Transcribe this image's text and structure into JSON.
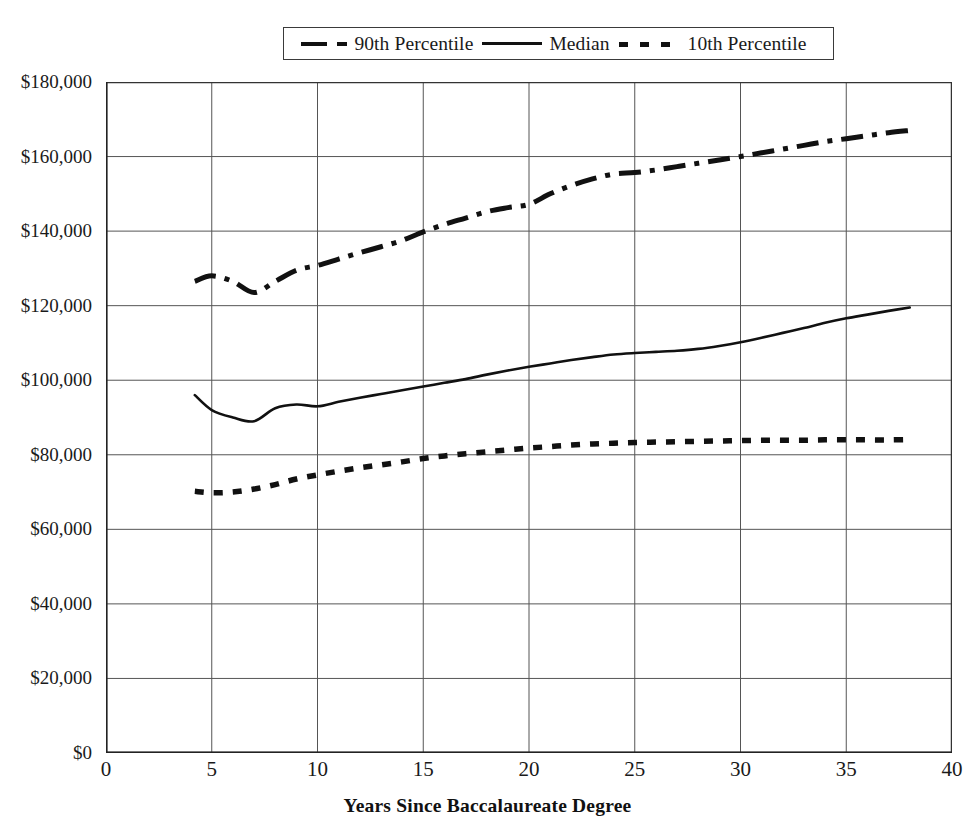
{
  "chart_data": {
    "type": "line",
    "title": "",
    "xlabel": "Years Since Baccalaureate Degree",
    "ylabel": "",
    "xlim": [
      0,
      40
    ],
    "ylim": [
      0,
      180000
    ],
    "grid": true,
    "legend_position": "top-center",
    "x_ticks": [
      0,
      5,
      10,
      15,
      20,
      25,
      30,
      35,
      40
    ],
    "x_tick_labels": [
      "0",
      "5",
      "10",
      "15",
      "20",
      "25",
      "30",
      "35",
      "40"
    ],
    "y_ticks": [
      0,
      20000,
      40000,
      60000,
      80000,
      100000,
      120000,
      140000,
      160000,
      180000
    ],
    "y_tick_labels": [
      "$0",
      "$20,000",
      "$40,000",
      "$60,000",
      "$80,000",
      "$100,000",
      "$120,000",
      "$140,000",
      "$160,000",
      "$180,000"
    ],
    "series": [
      {
        "name": "90th Percentile",
        "style": "dash-dot",
        "color": "#111111",
        "x": [
          4.2,
          5,
          6,
          7,
          8,
          9,
          10,
          11,
          12,
          13,
          14,
          15,
          16,
          17,
          18,
          19,
          20,
          21,
          22,
          23,
          24,
          25,
          26,
          27,
          28,
          29,
          30,
          31,
          32,
          33,
          34,
          35,
          36,
          37,
          38
        ],
        "values": [
          126500,
          128000,
          126500,
          123500,
          126500,
          129500,
          130800,
          132500,
          134200,
          135800,
          137500,
          139800,
          141800,
          143500,
          145200,
          146300,
          147200,
          150000,
          152200,
          154000,
          155300,
          155700,
          156400,
          157300,
          158200,
          159100,
          160000,
          161000,
          162000,
          163000,
          164000,
          164800,
          165600,
          166400,
          167000
        ]
      },
      {
        "name": "Median",
        "style": "solid",
        "color": "#111111",
        "x": [
          4.2,
          5,
          6,
          7,
          8,
          9,
          10,
          11,
          12,
          13,
          14,
          15,
          16,
          17,
          18,
          19,
          20,
          21,
          22,
          23,
          24,
          25,
          26,
          27,
          28,
          29,
          30,
          31,
          32,
          33,
          34,
          35,
          36,
          37,
          38
        ],
        "values": [
          96000,
          92000,
          90000,
          89000,
          92500,
          93500,
          93000,
          94200,
          95300,
          96300,
          97300,
          98300,
          99300,
          100300,
          101500,
          102600,
          103600,
          104500,
          105400,
          106200,
          106900,
          107300,
          107600,
          107900,
          108400,
          109200,
          110200,
          111400,
          112700,
          114000,
          115400,
          116600,
          117600,
          118600,
          119500
        ]
      },
      {
        "name": "10th Percentile",
        "style": "dotted",
        "color": "#111111",
        "x": [
          4.2,
          5,
          6,
          7,
          8,
          9,
          10,
          11,
          12,
          13,
          14,
          15,
          16,
          17,
          18,
          19,
          20,
          21,
          22,
          23,
          24,
          25,
          26,
          27,
          28,
          29,
          30,
          31,
          32,
          33,
          34,
          35,
          36,
          37,
          38
        ],
        "values": [
          70200,
          69800,
          70000,
          70800,
          72000,
          73500,
          74600,
          75600,
          76500,
          77300,
          78100,
          79000,
          79700,
          80300,
          80800,
          81300,
          81800,
          82200,
          82600,
          82900,
          83100,
          83300,
          83400,
          83500,
          83600,
          83700,
          83800,
          83900,
          83900,
          83900,
          84000,
          84000,
          84000,
          84000,
          84100
        ]
      }
    ]
  },
  "legend": {
    "items": [
      {
        "label": "90th Percentile",
        "style": "dash-dot"
      },
      {
        "label": "Median",
        "style": "solid"
      },
      {
        "label": "10th Percentile",
        "style": "dotted"
      }
    ]
  }
}
